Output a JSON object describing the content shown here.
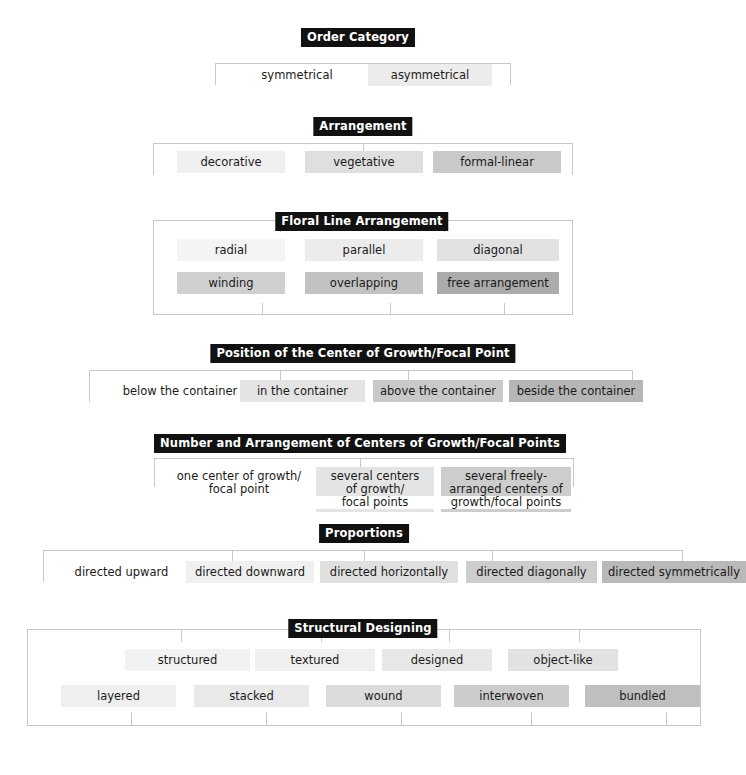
{
  "document": {
    "title": "Floral Design Ordering Criteria Chart",
    "background_color": "#ffffff",
    "line_color": "#c8c8c8",
    "title_chip_bg": "#111111",
    "title_chip_fg": "#ffffff"
  },
  "palette": {
    "shade_0": "#ffffff",
    "shade_1": "#f2f2f2",
    "shade_2": "#ececec",
    "shade_3": "#e2e2e2",
    "shade_4": "#d6d6d6",
    "shade_5": "#c9c9c9",
    "shade_6": "#b8b8b8",
    "shade_7": "#a8a8a8"
  },
  "sections": [
    {
      "id": "order-category",
      "title": "Order Category",
      "items": [
        {
          "label": "symmetrical",
          "shade": "#ffffff"
        },
        {
          "label": "asymmetrical",
          "shade": "#ececec"
        }
      ]
    },
    {
      "id": "arrangement",
      "title": "Arrangement",
      "items": [
        {
          "label": "decorative",
          "shade": "#f0f0f0"
        },
        {
          "label": "vegetative",
          "shade": "#dfdfdf"
        },
        {
          "label": "formal-linear",
          "shade": "#c9c9c9"
        }
      ]
    },
    {
      "id": "floral-line-arrangement",
      "title": "Floral Line Arrangement",
      "items": [
        {
          "label": "radial",
          "shade": "#f4f4f4"
        },
        {
          "label": "parallel",
          "shade": "#ececec"
        },
        {
          "label": "diagonal",
          "shade": "#e2e2e2"
        },
        {
          "label": "winding",
          "shade": "#cfcfcf"
        },
        {
          "label": "overlapping",
          "shade": "#c2c2c2"
        },
        {
          "label": "free arrangement",
          "shade": "#ababab"
        }
      ]
    },
    {
      "id": "position-center-growth",
      "title": "Position of the Center of Growth/Focal Point",
      "items": [
        {
          "label": "below the container",
          "shade": "#ffffff"
        },
        {
          "label": "in the container",
          "shade": "#e4e4e4"
        },
        {
          "label": "above the container",
          "shade": "#c9c9c9"
        },
        {
          "label": "beside the container",
          "shade": "#b6b6b6"
        }
      ]
    },
    {
      "id": "number-arrangement-centers",
      "title": "Number and Arrangement of Centers of Growth/Focal Points",
      "items": [
        {
          "lines": [
            "one center of growth/",
            "focal point"
          ],
          "shade": "#ffffff"
        },
        {
          "lines": [
            "several centers",
            "of growth/",
            "focal points"
          ],
          "shade": "#e4e4e4"
        },
        {
          "lines": [
            "several freely-",
            "arranged centers of",
            "growth/focal points"
          ],
          "shade": "#cdcdcd"
        }
      ]
    },
    {
      "id": "proportions",
      "title": "Proportions",
      "items": [
        {
          "label": "directed upward",
          "shade": "#ffffff"
        },
        {
          "label": "directed downward",
          "shade": "#f0f0f0"
        },
        {
          "label": "directed horizontally",
          "shade": "#e0e0e0"
        },
        {
          "label": "directed diagonally",
          "shade": "#cdcdcd"
        },
        {
          "label": "directed symmetrically",
          "shade": "#b9b9b9"
        }
      ]
    },
    {
      "id": "structural-designing",
      "title": "Structural Designing",
      "items": [
        {
          "label": "structured",
          "shade": "#f2f2f2"
        },
        {
          "label": "textured",
          "shade": "#efefef"
        },
        {
          "label": "designed",
          "shade": "#e8e8e8"
        },
        {
          "label": "object-like",
          "shade": "#e2e2e2"
        },
        {
          "label": "layered",
          "shade": "#efefef"
        },
        {
          "label": "stacked",
          "shade": "#e9e9e9"
        },
        {
          "label": "wound",
          "shade": "#dcdcdc"
        },
        {
          "label": "interwoven",
          "shade": "#cccccc"
        },
        {
          "label": "bundled",
          "shade": "#bfbfbf"
        }
      ]
    }
  ]
}
